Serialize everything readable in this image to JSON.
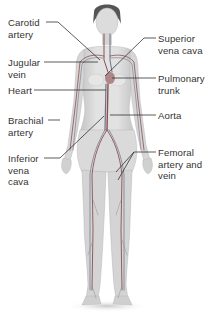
{
  "diagram": {
    "colors": {
      "skin": "#d9d9d9",
      "skin_shadow": "#b8b8b8",
      "vessel_artery": "#9a5a5a",
      "vessel_vein": "#7a7a8a",
      "label_text": "#333333",
      "leader_line": "#333333",
      "background": "#ffffff"
    },
    "labels_left": [
      {
        "id": "carotid-artery",
        "text": "Carotid\nartery",
        "x": 8,
        "y": 17
      },
      {
        "id": "jugular-vein",
        "text": "Jugular\nvein",
        "x": 8,
        "y": 57
      },
      {
        "id": "heart",
        "text": "Heart",
        "x": 8,
        "y": 85
      },
      {
        "id": "brachial-artery",
        "text": "Brachial\nartery",
        "x": 8,
        "y": 115
      },
      {
        "id": "inferior-vena-cava",
        "text": "Inferior\nvena\ncava",
        "x": 8,
        "y": 153
      }
    ],
    "labels_right": [
      {
        "id": "superior-vena-cava",
        "text": "Superior\nvena cava",
        "x": 158,
        "y": 33
      },
      {
        "id": "pulmonary-trunk",
        "text": "Pulmonary\ntrunk",
        "x": 158,
        "y": 73
      },
      {
        "id": "aorta",
        "text": "Aorta",
        "x": 158,
        "y": 110
      },
      {
        "id": "femoral-artery-and-vein",
        "text": "Femoral\nartery and\nvein",
        "x": 158,
        "y": 147
      }
    ]
  }
}
